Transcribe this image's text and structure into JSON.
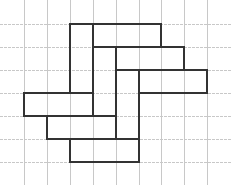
{
  "diagram": {
    "title": "",
    "colors": {
      "grid": "#c8c8c8",
      "outline": "#333333",
      "background": "#ffffff"
    },
    "grid": {
      "vertical_x": [
        24,
        47,
        70,
        93,
        116,
        139,
        161,
        184,
        207
      ],
      "horizontal_y": [
        24,
        47,
        70,
        93,
        116,
        139,
        162
      ],
      "extent": {
        "x0": 0,
        "x1": 232,
        "y0": 0,
        "y1": 185
      }
    },
    "segments": [
      [
        70,
        24,
        161,
        24
      ],
      [
        70,
        24,
        70,
        93
      ],
      [
        93,
        24,
        93,
        116
      ],
      [
        161,
        24,
        161,
        47
      ],
      [
        93,
        47,
        184,
        47
      ],
      [
        184,
        47,
        184,
        70
      ],
      [
        116,
        47,
        116,
        139
      ],
      [
        116,
        70,
        207,
        70
      ],
      [
        207,
        70,
        207,
        93
      ],
      [
        139,
        93,
        207,
        93
      ],
      [
        139,
        70,
        139,
        162
      ],
      [
        24,
        93,
        93,
        93
      ],
      [
        24,
        93,
        24,
        116
      ],
      [
        24,
        116,
        116,
        116
      ],
      [
        47,
        116,
        47,
        139
      ],
      [
        47,
        139,
        139,
        139
      ],
      [
        70,
        139,
        70,
        162
      ],
      [
        70,
        162,
        139,
        162
      ]
    ]
  }
}
